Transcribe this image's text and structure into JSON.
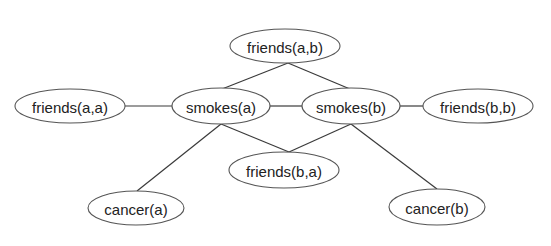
{
  "diagram": {
    "type": "undirected-graph",
    "colors": {
      "background": "#ffffff",
      "edge": "#3a3a3a",
      "node_border": "#555555",
      "label": "#222222"
    },
    "nodes": [
      {
        "id": "friends_ab",
        "label": "friends(a,b)",
        "cx": 285,
        "cy": 46,
        "rx": 55,
        "ry": 17
      },
      {
        "id": "friends_aa",
        "label": "friends(a,a)",
        "cx": 70,
        "cy": 106,
        "rx": 55,
        "ry": 17
      },
      {
        "id": "smokes_a",
        "label": "smokes(a)",
        "cx": 221,
        "cy": 106,
        "rx": 49,
        "ry": 18
      },
      {
        "id": "smokes_b",
        "label": "smokes(b)",
        "cx": 351,
        "cy": 106,
        "rx": 49,
        "ry": 18
      },
      {
        "id": "friends_bb",
        "label": "friends(b,b)",
        "cx": 478,
        "cy": 106,
        "rx": 55,
        "ry": 17
      },
      {
        "id": "friends_ba",
        "label": "friends(b,a)",
        "cx": 284,
        "cy": 170,
        "rx": 55,
        "ry": 18
      },
      {
        "id": "cancer_a",
        "label": "cancer(a)",
        "cx": 136,
        "cy": 208,
        "rx": 48,
        "ry": 17
      },
      {
        "id": "cancer_b",
        "label": "cancer(b)",
        "cx": 437,
        "cy": 207,
        "rx": 48,
        "ry": 18
      }
    ],
    "edges": [
      {
        "from": "friends_ab",
        "to": "smokes_a",
        "x1": 288,
        "y1": 63,
        "x2": 222,
        "y2": 89
      },
      {
        "from": "friends_ab",
        "to": "smokes_b",
        "x1": 288,
        "y1": 63,
        "x2": 350,
        "y2": 89
      },
      {
        "from": "friends_aa",
        "to": "smokes_a",
        "x1": 125,
        "y1": 106,
        "x2": 172,
        "y2": 106
      },
      {
        "from": "smokes_a",
        "to": "smokes_b",
        "x1": 270,
        "y1": 106,
        "x2": 302,
        "y2": 106
      },
      {
        "from": "smokes_b",
        "to": "friends_bb",
        "x1": 400,
        "y1": 106,
        "x2": 423,
        "y2": 106
      },
      {
        "from": "smokes_a",
        "to": "friends_ba",
        "x1": 221,
        "y1": 124,
        "x2": 289,
        "y2": 152
      },
      {
        "from": "smokes_b",
        "to": "friends_ba",
        "x1": 351,
        "y1": 124,
        "x2": 289,
        "y2": 152
      },
      {
        "from": "smokes_a",
        "to": "cancer_a",
        "x1": 221,
        "y1": 124,
        "x2": 137,
        "y2": 191
      },
      {
        "from": "smokes_b",
        "to": "cancer_b",
        "x1": 351,
        "y1": 124,
        "x2": 437,
        "y2": 189
      }
    ]
  }
}
